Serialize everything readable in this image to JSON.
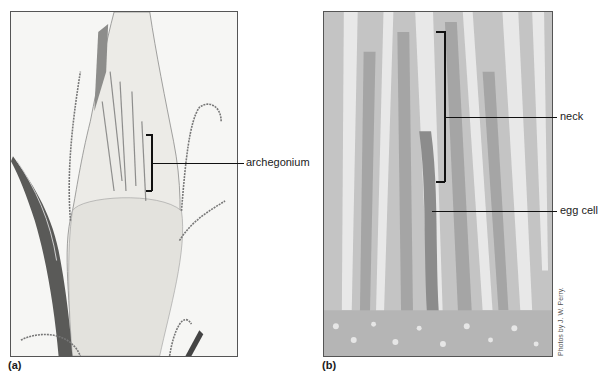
{
  "figure": {
    "panels": [
      {
        "id": "a",
        "label": "(a)",
        "description": "Light micrograph, longitudinal section of moss shoot tip with archegonia",
        "callouts": [
          {
            "text": "archegonium"
          }
        ]
      },
      {
        "id": "b",
        "label": "(b)",
        "description": "Light micrograph, close-up of archegonium",
        "callouts": [
          {
            "text": "neck"
          },
          {
            "text": "egg cell"
          }
        ]
      }
    ],
    "credit": "Photos by J. W. Perry."
  }
}
